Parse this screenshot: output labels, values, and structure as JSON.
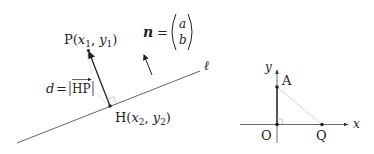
{
  "left_diagram": {
    "line_label": "ℓ",
    "point_p": {
      "label": "P",
      "coords": "(x₁, y₁)",
      "var1": "x",
      "sub1": "1",
      "var2": "y",
      "sub2": "1"
    },
    "point_h": {
      "label": "H",
      "var1": "x",
      "sub1": "2",
      "var2": "y",
      "sub2": "2"
    },
    "distance_label": {
      "lhs": "d",
      "eq": "=",
      "vector": "HP"
    },
    "normal_vector": {
      "name": "n",
      "eq": "=",
      "components": [
        "a",
        "b"
      ]
    }
  },
  "right_diagram": {
    "x_axis_label": "x",
    "y_axis_label": "y",
    "origin_label": "O",
    "point_a_label": "A",
    "point_q_label": "Q"
  },
  "colors": {
    "stroke": "#333333",
    "dotted": "#999999",
    "text": "#222222",
    "background": "#ffffff"
  }
}
